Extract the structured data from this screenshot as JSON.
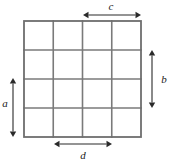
{
  "figure": {
    "grid": {
      "rows": 4,
      "cols": 4,
      "left": 24,
      "top": 21,
      "right": 141,
      "bottom": 137,
      "cell_width": 29.25,
      "cell_height": 29,
      "line_color": "#7a7a7a",
      "border_color": "#6e6e6e",
      "fill_color": "#ffffff"
    },
    "dimensions": [
      {
        "id": "a",
        "label": "a",
        "orientation": "vertical",
        "spans_cells": 2,
        "x": 13,
        "y_start": 78,
        "y_end": 137,
        "label_x": 5,
        "label_y": 104,
        "side": "left"
      },
      {
        "id": "b",
        "label": "b",
        "orientation": "vertical",
        "spans_cells": 2,
        "x": 152,
        "y_start": 50,
        "y_end": 108,
        "label_x": 164,
        "label_y": 80,
        "side": "right"
      },
      {
        "id": "c",
        "label": "c",
        "orientation": "horizontal",
        "spans_cells": 2,
        "y": 15,
        "x_start": 83,
        "x_end": 141,
        "label_x": 111,
        "label_y": 7,
        "side": "top"
      },
      {
        "id": "d",
        "label": "d",
        "orientation": "horizontal",
        "spans_cells": 2,
        "y": 144,
        "x_start": 54,
        "x_end": 112,
        "label_x": 83,
        "label_y": 156,
        "side": "bottom"
      }
    ]
  },
  "colors": {
    "background": "#ffffff",
    "grid": "#7a7a7a",
    "arrow": "#2a2a2a",
    "text": "#1a1a1a"
  }
}
